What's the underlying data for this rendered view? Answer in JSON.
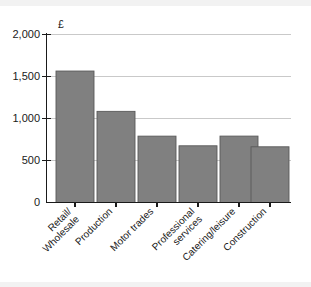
{
  "chart_data": {
    "type": "bar",
    "title": "",
    "subtitle": "",
    "xlabel": "",
    "ylabel": "£",
    "unit_symbol": "£",
    "categories": [
      "Retail/ Wholesale",
      "Production",
      "Motor trades",
      "Professional services",
      "Catering/leisure",
      "Construction"
    ],
    "category_lines": [
      [
        "Retail/",
        "Wholesale"
      ],
      [
        "Production"
      ],
      [
        "Motor trades"
      ],
      [
        "Professional",
        "services"
      ],
      [
        "Catering/leisure"
      ],
      [
        "Construction"
      ]
    ],
    "values": [
      1860,
      1740,
      1565,
      1085,
      790,
      675
    ],
    "ylim": [
      0,
      2000
    ],
    "yticks": [
      0,
      500,
      1000,
      1500,
      2000
    ],
    "ytick_labels": [
      "0",
      "500",
      "1,000",
      "1,500",
      "2,000"
    ],
    "grid": true,
    "legend": false,
    "bar_color": "#808080",
    "bar_edge_color": "#595959",
    "grid_color": "#c9c9c9",
    "axis_color": "#1a1a1a",
    "background": "#ffffff",
    "xtick_label_rotation": -45
  }
}
